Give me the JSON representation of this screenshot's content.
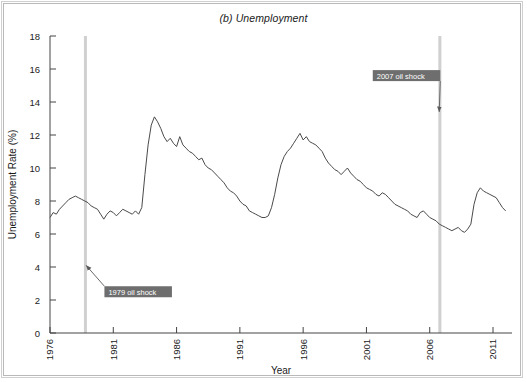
{
  "chart_data": {
    "type": "line",
    "title": "(b) Unemployment",
    "xlabel": "Year",
    "ylabel": "Unemployment Rate (%)",
    "xlim": [
      1976,
      2012.5
    ],
    "ylim": [
      0,
      18
    ],
    "xticks": [
      1976,
      1981,
      1986,
      1991,
      1996,
      2001,
      2006,
      2011
    ],
    "xtick_labels": [
      "1976",
      "1981",
      "1986",
      "1991",
      "1996",
      "2001",
      "2006",
      "2011"
    ],
    "yticks": [
      0,
      2,
      4,
      6,
      8,
      10,
      12,
      14,
      16,
      18
    ],
    "ytick_labels": [
      "0",
      "2",
      "4",
      "6",
      "8",
      "10",
      "12",
      "14",
      "16",
      "18"
    ],
    "grid": false,
    "legend": null,
    "line_color": "#4a4a4a",
    "vline_color": "#d0d0d0",
    "annotation_bg": "#6e6e6e",
    "annotation_fg": "#ffffff",
    "series": [
      {
        "name": "Unemployment Rate (%)",
        "x": [
          1976.0,
          1976.25,
          1976.5,
          1976.75,
          1977.0,
          1977.25,
          1977.5,
          1977.75,
          1978.0,
          1978.25,
          1978.5,
          1978.75,
          1979.0,
          1979.25,
          1979.5,
          1979.75,
          1980.0,
          1980.25,
          1980.5,
          1980.75,
          1981.0,
          1981.25,
          1981.5,
          1981.75,
          1982.0,
          1982.25,
          1982.5,
          1982.75,
          1983.0,
          1983.25,
          1983.5,
          1983.75,
          1984.0,
          1984.25,
          1984.5,
          1984.75,
          1985.0,
          1985.25,
          1985.5,
          1985.75,
          1986.0,
          1986.25,
          1986.5,
          1986.75,
          1987.0,
          1987.25,
          1987.5,
          1987.75,
          1988.0,
          1988.25,
          1988.5,
          1988.75,
          1989.0,
          1989.25,
          1989.5,
          1989.75,
          1990.0,
          1990.25,
          1990.5,
          1990.75,
          1991.0,
          1991.25,
          1991.5,
          1991.75,
          1992.0,
          1992.25,
          1992.5,
          1992.75,
          1993.0,
          1993.25,
          1993.5,
          1993.75,
          1994.0,
          1994.25,
          1994.5,
          1994.75,
          1995.0,
          1995.25,
          1995.5,
          1995.75,
          1996.0,
          1996.25,
          1996.5,
          1996.75,
          1997.0,
          1997.25,
          1997.5,
          1997.75,
          1998.0,
          1998.25,
          1998.5,
          1998.75,
          1999.0,
          1999.25,
          1999.5,
          1999.75,
          2000.0,
          2000.25,
          2000.5,
          2000.75,
          2001.0,
          2001.25,
          2001.5,
          2001.75,
          2002.0,
          2002.25,
          2002.5,
          2002.75,
          2003.0,
          2003.25,
          2003.5,
          2003.75,
          2004.0,
          2004.25,
          2004.5,
          2004.75,
          2005.0,
          2005.25,
          2005.5,
          2005.75,
          2006.0,
          2006.25,
          2006.5,
          2006.75,
          2007.0,
          2007.25,
          2007.5,
          2007.75,
          2008.0,
          2008.25,
          2008.5,
          2008.75,
          2009.0,
          2009.25,
          2009.5,
          2009.75,
          2010.0,
          2010.25,
          2010.5,
          2010.75,
          2011.0,
          2011.25,
          2011.5,
          2011.75,
          2012.0
        ],
        "y": [
          7.0,
          7.3,
          7.2,
          7.5,
          7.7,
          7.9,
          8.1,
          8.2,
          8.3,
          8.2,
          8.1,
          8.0,
          7.9,
          7.7,
          7.6,
          7.5,
          7.2,
          6.9,
          7.2,
          7.4,
          7.3,
          7.1,
          7.3,
          7.5,
          7.4,
          7.3,
          7.2,
          7.4,
          7.2,
          7.6,
          9.6,
          11.4,
          12.6,
          13.1,
          12.8,
          12.4,
          11.9,
          11.6,
          11.8,
          11.5,
          11.3,
          11.9,
          11.4,
          11.2,
          11.0,
          10.9,
          10.7,
          10.5,
          10.6,
          10.2,
          10.0,
          9.9,
          9.7,
          9.5,
          9.3,
          9.1,
          8.8,
          8.6,
          8.5,
          8.3,
          8.0,
          7.8,
          7.7,
          7.4,
          7.3,
          7.2,
          7.1,
          7.0,
          7.0,
          7.1,
          7.6,
          8.4,
          9.4,
          10.2,
          10.7,
          11.0,
          11.2,
          11.5,
          11.8,
          12.1,
          11.7,
          11.9,
          11.6,
          11.5,
          11.4,
          11.2,
          11.0,
          10.6,
          10.3,
          10.1,
          9.9,
          9.8,
          9.6,
          9.8,
          10.0,
          9.7,
          9.5,
          9.3,
          9.2,
          9.0,
          8.8,
          8.7,
          8.6,
          8.4,
          8.3,
          8.5,
          8.4,
          8.2,
          8.0,
          7.8,
          7.7,
          7.6,
          7.5,
          7.4,
          7.2,
          7.1,
          7.0,
          7.3,
          7.4,
          7.2,
          7.0,
          6.9,
          6.8,
          6.6,
          6.5,
          6.4,
          6.3,
          6.2,
          6.3,
          6.4,
          6.2,
          6.1,
          6.3,
          6.6,
          7.8,
          8.5,
          8.8,
          8.6,
          8.5,
          8.4,
          8.3,
          8.2,
          7.9,
          7.6,
          7.4
        ]
      }
    ],
    "annotations": [
      {
        "label": "1979 oil shock",
        "x_line": 1978.8,
        "box_x": 1980.3,
        "box_y": 2.5,
        "arrow_to_x": 1978.85,
        "arrow_to_y": 4.1
      },
      {
        "label": "2007 oil shock",
        "x_line": 2006.8,
        "box_x": 2001.5,
        "box_y": 15.6,
        "arrow_to_x": 2006.75,
        "arrow_to_y": 13.4
      }
    ]
  }
}
